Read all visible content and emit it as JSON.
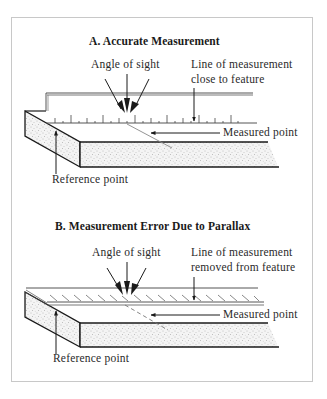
{
  "panel_a": {
    "title": "A. Accurate Measurement",
    "angle_label": "Angle of sight",
    "line_label_1": "Line of measurement",
    "line_label_2": "close to feature",
    "measured_label": "Measured point",
    "reference_label": "Reference point",
    "ruler_marking": "scale ticks, vertical (ruler on edge)"
  },
  "panel_b": {
    "title": "B. Measurement Error Due to Parallax",
    "angle_label": "Angle of sight",
    "line_label_1": "Line of measurement",
    "line_label_2": "removed from feature",
    "measured_label": "Measured point",
    "reference_label": "Reference point",
    "ruler_marking": "scale ticks, slanted (ruler lying flat)"
  },
  "colors": {
    "line": "#1a1a1a",
    "frame": "#c8c8c8",
    "stipple": "#9a9a9a",
    "background": "#ffffff"
  }
}
